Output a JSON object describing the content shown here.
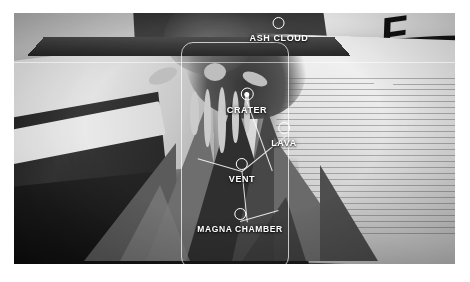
{
  "app": {
    "view_mode": "ar-camera-view",
    "subject": "volcano model"
  },
  "overlay": {
    "frame_label": "object-bounding-frame",
    "scanline_label": "horizon-scan-line"
  },
  "hotspots": [
    {
      "id": "ash-cloud",
      "label": "ASH CLOUD",
      "marker": "ring-marker",
      "state": "inactive",
      "x": 265,
      "y": 17
    },
    {
      "id": "crater",
      "label": "CRATER",
      "marker": "ring-marker-filled",
      "state": "active",
      "x": 233,
      "y": 88
    },
    {
      "id": "lava",
      "label": "LAVA",
      "marker": "ring-marker",
      "state": "inactive",
      "x": 270,
      "y": 122
    },
    {
      "id": "vent",
      "label": "VENT",
      "marker": "ring-marker",
      "state": "inactive",
      "x": 228,
      "y": 158
    },
    {
      "id": "magna-chamber",
      "label": "MAGNA CHAMBER",
      "marker": "ring-marker",
      "state": "inactive",
      "x": 226,
      "y": 208
    }
  ],
  "scene": {
    "magazine_glyphs": "F",
    "background": "desk with open books and printed pages"
  },
  "colors": {
    "overlay_stroke": "#ffffff",
    "label_text": "#ffffff",
    "page_background": "#ffffff"
  }
}
